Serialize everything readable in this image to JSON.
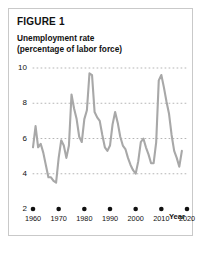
{
  "figure": {
    "label": "FIGURE 1",
    "subtitle_line1": "Unemployment rate",
    "subtitle_line2": "(percentage of labor force)",
    "axis_note": "Year"
  },
  "colors": {
    "line": "#a8a8a8",
    "gridline": "#b5b5b5",
    "marker": "#111111",
    "border": "#c9c9c9",
    "text": "#111111",
    "background": "#ffffff"
  },
  "chart_data": {
    "type": "line",
    "title": "Unemployment rate (percentage of labor force)",
    "xlabel": "Year",
    "ylabel": "",
    "xlim": [
      1960,
      2020
    ],
    "ylim": [
      2,
      10
    ],
    "yticks": [
      2,
      4,
      6,
      8,
      10
    ],
    "xticks": [
      1960,
      1970,
      1980,
      1990,
      2000,
      2010,
      2020
    ],
    "grid": "horizontal-dotted",
    "legend": "none",
    "series": [
      {
        "name": "Unemployment rate",
        "x": [
          1960,
          1961,
          1962,
          1963,
          1964,
          1965,
          1966,
          1967,
          1968,
          1969,
          1970,
          1971,
          1972,
          1973,
          1974,
          1975,
          1976,
          1977,
          1978,
          1979,
          1980,
          1981,
          1982,
          1983,
          1984,
          1985,
          1986,
          1987,
          1988,
          1989,
          1990,
          1991,
          1992,
          1993,
          1994,
          1995,
          1996,
          1997,
          1998,
          1999,
          2000,
          2001,
          2002,
          2003,
          2004,
          2005,
          2006,
          2007,
          2008,
          2009,
          2010,
          2011,
          2012,
          2013,
          2014,
          2015,
          2016,
          2017,
          2018
        ],
        "values": [
          5.5,
          6.7,
          5.5,
          5.7,
          5.2,
          4.5,
          3.8,
          3.8,
          3.6,
          3.5,
          4.9,
          5.9,
          5.6,
          4.9,
          5.6,
          8.5,
          7.7,
          7.1,
          6.1,
          5.8,
          7.1,
          7.6,
          9.7,
          9.6,
          7.5,
          7.2,
          7.0,
          6.2,
          5.5,
          5.3,
          5.6,
          6.8,
          7.5,
          6.9,
          6.1,
          5.6,
          5.4,
          4.9,
          4.5,
          4.2,
          4.0,
          4.7,
          5.8,
          6.0,
          5.5,
          5.1,
          4.6,
          4.6,
          5.8,
          9.3,
          9.6,
          8.9,
          8.1,
          7.4,
          6.2,
          5.3,
          4.9,
          4.4,
          5.3
        ]
      }
    ]
  }
}
